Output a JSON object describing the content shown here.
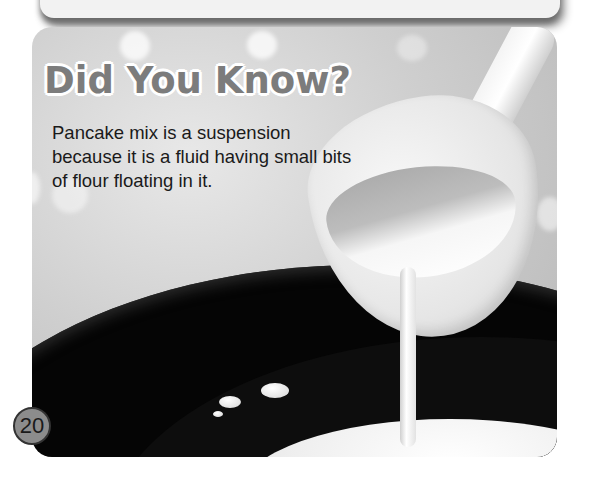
{
  "callout": {
    "title": "Did You Know?",
    "body": "Pancake mix is a suspension because it is a fluid having small bits of flour floating in it."
  },
  "photo": {
    "subject": "ladle pouring pancake batter into a black frying pan"
  },
  "page": {
    "number": "20"
  }
}
